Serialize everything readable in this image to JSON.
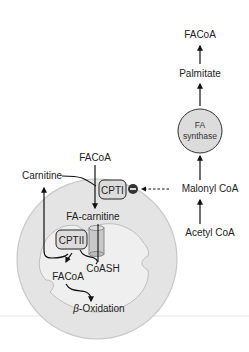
{
  "diagram": {
    "colors": {
      "background": "#ffffff",
      "mito_outer_fill": "#e4e4e4",
      "mito_outer_stroke": "#c4c4c4",
      "mito_inner_fill": "#eeeeee",
      "enzyme_fill": "#dcdcdc",
      "line": "#111111",
      "inhibitor": "#333333"
    },
    "nodes": {
      "facoa_top": "FACoA",
      "palmitate": "Palmitate",
      "fa_synthase_line1": "FA",
      "fa_synthase_line2": "synthase",
      "malonyl_coa": "Malonyl CoA",
      "acetyl_coa": "Acetyl CoA",
      "facoa_cytosol": "FACoA",
      "carnitine": "Carnitine",
      "cpt1": "CPTI",
      "fa_carnitine": "FA-carnitine",
      "cpt2": "CPTII",
      "coash": "CoASH",
      "facoa_matrix": "FACoA",
      "beta_prefix": "β",
      "beta_oxidation": "-Oxidation"
    },
    "inhibition_symbol": "−"
  }
}
